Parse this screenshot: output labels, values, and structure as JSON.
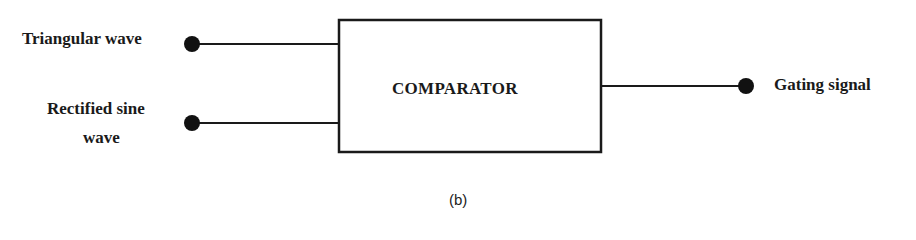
{
  "diagram": {
    "block": {
      "label": "COMPARATOR"
    },
    "inputs": [
      {
        "label": "Triangular wave"
      },
      {
        "label_line1": "Rectified sine",
        "label_line2": "wave"
      }
    ],
    "output": {
      "label": "Gating signal"
    },
    "caption": "(b)",
    "colors": {
      "stroke": "#1a1a1a",
      "background": "#ffffff"
    }
  }
}
